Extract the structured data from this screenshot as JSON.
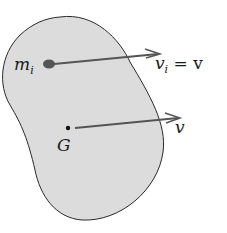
{
  "diagram": {
    "body_fill": "#dcdcdc",
    "body_stroke": "#2a2a2a",
    "arrow_color": "#555555",
    "particle_color": "#555555",
    "labels": {
      "particle_mass": "m",
      "particle_mass_sub": "i",
      "particle_velocity": "v",
      "particle_velocity_sub": "i",
      "particle_velocity_eq": " = v",
      "center_of_mass": "G",
      "cm_velocity": "v"
    }
  }
}
